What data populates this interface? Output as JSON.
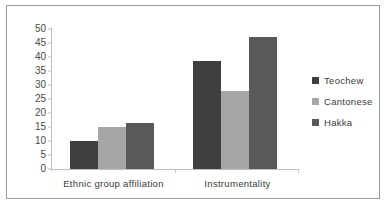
{
  "chart_data": {
    "type": "bar",
    "title": "",
    "xlabel": "",
    "ylabel": "",
    "categories": [
      "Ethnic group affiliation",
      "Instrumentality"
    ],
    "series": [
      {
        "name": "Teochew",
        "color": "#3f3f3f",
        "values": [
          10,
          38.5
        ]
      },
      {
        "name": "Cantonese",
        "color": "#a6a6a6",
        "values": [
          15,
          28
        ]
      },
      {
        "name": "Hakka",
        "color": "#595959",
        "values": [
          16.5,
          47
        ]
      }
    ],
    "ylim": [
      0,
      50
    ],
    "yticks": [
      0,
      5,
      10,
      15,
      20,
      25,
      30,
      35,
      40,
      45,
      50
    ],
    "ytick_labels": [
      "0",
      "5",
      "10",
      "15",
      "20",
      "25",
      "30",
      "35",
      "40",
      "45",
      "50"
    ],
    "grid": false,
    "legend_position": "right",
    "legend_entries": [
      "Teochew",
      "Cantonese",
      "Hakka"
    ]
  },
  "axis": {
    "y_labels": [
      "50",
      "45",
      "40",
      "35",
      "30",
      "25",
      "20",
      "15",
      "10",
      "5",
      "0"
    ]
  },
  "colors": {
    "teochew": "#3f3f3f",
    "cantonese": "#a6a6a6",
    "hakka": "#595959",
    "axis": "#bfbfbf",
    "frame": "#9a9a9a",
    "text": "#3a3a3a"
  }
}
